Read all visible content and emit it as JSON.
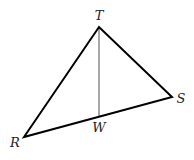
{
  "diagram": {
    "type": "triangle",
    "vertices": {
      "T": {
        "label": "T",
        "x": 99,
        "y": 27
      },
      "R": {
        "label": "R",
        "x": 24,
        "y": 137
      },
      "S": {
        "label": "S",
        "x": 172,
        "y": 97
      }
    },
    "points": {
      "W": {
        "label": "W",
        "x": 99,
        "y": 117,
        "on_segment": "RS"
      }
    },
    "segments": [
      {
        "from": "T",
        "to": "R",
        "color": "#000000"
      },
      {
        "from": "T",
        "to": "S",
        "color": "#000000"
      },
      {
        "from": "R",
        "to": "S",
        "color": "#000000"
      },
      {
        "from": "T",
        "to": "W",
        "color": "#a8a8a8"
      }
    ],
    "colors": {
      "triangle": "#000000",
      "segment_TW": "#a8a8a8"
    }
  }
}
